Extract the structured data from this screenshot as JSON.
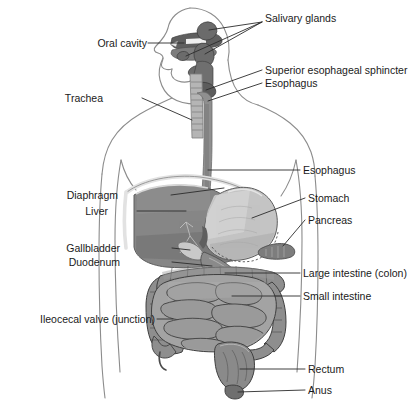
{
  "figure": {
    "type": "anatomical-diagram",
    "width": 415,
    "height": 402,
    "background": "#ffffff"
  },
  "colors": {
    "background": "#ffffff",
    "body_outline": "#8c8c8c",
    "leader_line": "#2b2b2b",
    "label_text": "#1a1a1a",
    "liver": "#868686",
    "liver_dark": "#6f6f6f",
    "liver_edge": "#d8d8d8",
    "stomach": "#c4c4c4",
    "stomach_edge": "#8a8a8a",
    "esophagus": "#8f8f8f",
    "esophagus_dark": "#7a7a7a",
    "trachea": "#b5b5b5",
    "salivary_gland": "#6b6b6b",
    "oral_cavity": "#5f5f5f",
    "large_intestine": "#8e8e8e",
    "small_intestine": "#a3a3a3",
    "intestine_outline": "#4a4a4a",
    "pancreas": "#7d7d7d",
    "gallbladder": "#c9c9c9",
    "rectum": "#8a8a8a"
  },
  "labels": {
    "right": [
      {
        "id": "salivary-glands",
        "text": "Salivary glands",
        "x": 265,
        "y": 18
      },
      {
        "id": "superior-esophageal-sphincter",
        "text": "Superior esophageal sphincter",
        "x": 265,
        "y": 66
      },
      {
        "id": "esophagus-upper",
        "text": "Esophagus",
        "x": 265,
        "y": 79
      },
      {
        "id": "esophagus-lower",
        "text": "Esophagus",
        "x": 303,
        "y": 165
      },
      {
        "id": "stomach",
        "text": "Stomach",
        "x": 308,
        "y": 193
      },
      {
        "id": "pancreas",
        "text": "Pancreas",
        "x": 308,
        "y": 215
      },
      {
        "id": "large-intestine",
        "text": "Large intestine (colon)",
        "x": 303,
        "y": 268
      },
      {
        "id": "small-intestine",
        "text": "Small intestine",
        "x": 303,
        "y": 291
      },
      {
        "id": "rectum",
        "text": "Rectum",
        "x": 308,
        "y": 364
      },
      {
        "id": "anus",
        "text": "Anus",
        "x": 308,
        "y": 385
      }
    ],
    "left": [
      {
        "id": "oral-cavity",
        "text": "Oral cavity",
        "x": 147,
        "y": 38
      },
      {
        "id": "trachea",
        "text": "Trachea",
        "x": 103,
        "y": 93
      },
      {
        "id": "diaphragm",
        "text": "Diaphragm",
        "x": 118,
        "y": 190
      },
      {
        "id": "liver",
        "text": "Liver",
        "x": 108,
        "y": 206
      },
      {
        "id": "gallbladder",
        "text": "Gallbladder",
        "x": 120,
        "y": 243
      },
      {
        "id": "duodenum",
        "text": "Duodenum",
        "x": 120,
        "y": 257
      },
      {
        "id": "ileocecal-valve",
        "text": "Ileocecal valve (junction)",
        "x": 155,
        "y": 314
      }
    ]
  },
  "structures": [
    {
      "id": "oral-cavity",
      "name": "Oral cavity"
    },
    {
      "id": "salivary-glands",
      "name": "Salivary glands"
    },
    {
      "id": "trachea",
      "name": "Trachea"
    },
    {
      "id": "superior-esophageal-sphincter",
      "name": "Superior esophageal sphincter"
    },
    {
      "id": "esophagus",
      "name": "Esophagus"
    },
    {
      "id": "diaphragm",
      "name": "Diaphragm"
    },
    {
      "id": "liver",
      "name": "Liver"
    },
    {
      "id": "gallbladder",
      "name": "Gallbladder"
    },
    {
      "id": "duodenum",
      "name": "Duodenum"
    },
    {
      "id": "stomach",
      "name": "Stomach"
    },
    {
      "id": "pancreas",
      "name": "Pancreas"
    },
    {
      "id": "large-intestine",
      "name": "Large intestine (colon)"
    },
    {
      "id": "small-intestine",
      "name": "Small intestine"
    },
    {
      "id": "ileocecal-valve",
      "name": "Ileocecal valve (junction)"
    },
    {
      "id": "rectum",
      "name": "Rectum"
    },
    {
      "id": "anus",
      "name": "Anus"
    }
  ]
}
